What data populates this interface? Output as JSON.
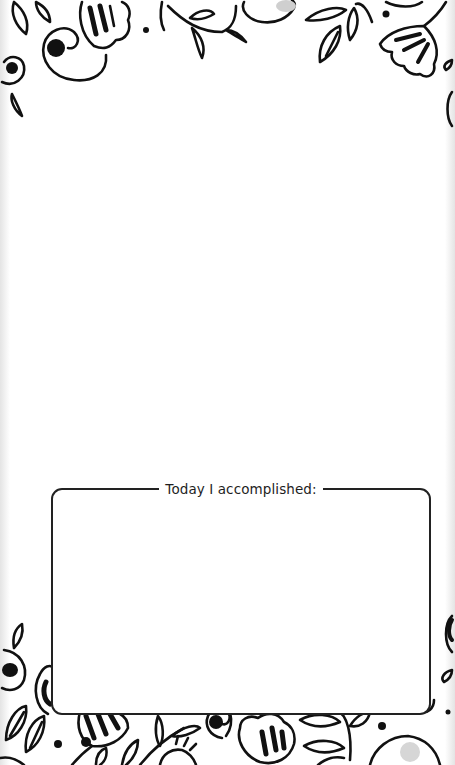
{
  "page": {
    "type": "printable journal page",
    "decoration": {
      "top_border": "floral-doodle-border",
      "bottom_border": "floral-doodle-border",
      "stroke_color": "#111111",
      "background_color": "#ffffff"
    }
  },
  "accomplished_box": {
    "label": "Today I accomplished:",
    "border_color": "#222222",
    "content": ""
  }
}
